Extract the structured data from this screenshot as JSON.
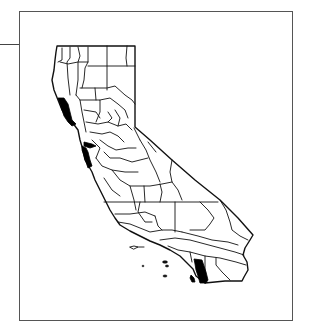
{
  "figure": {
    "type": "county-map",
    "region": "California counties",
    "highlight_color": "#000000",
    "line_color": "#111111",
    "background": "#ffffff",
    "frame_color": "#555555",
    "highlighted_regions": [
      {
        "id": "north-coast",
        "label": "Mendocino (north coast, shaded)"
      },
      {
        "id": "bay-area",
        "label": "San Francisco / San Mateo (bay area, shaded)"
      },
      {
        "id": "south",
        "label": "Riverside/San Diego west (southern, shaded)"
      }
    ],
    "islands": [
      "channel-islands"
    ]
  }
}
